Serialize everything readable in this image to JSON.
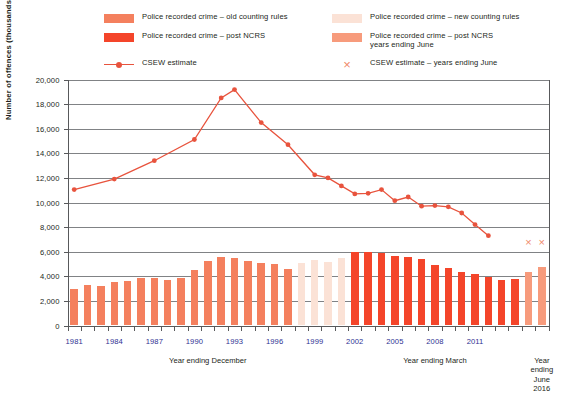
{
  "legend": {
    "items": [
      {
        "id": "old-counting-rules",
        "type": "swatch",
        "color": "#f4805e",
        "label": "Police recorded crime – old counting rules",
        "col": 0,
        "row": 0
      },
      {
        "id": "new-counting-rules",
        "type": "swatch",
        "color": "#fbe2d6",
        "label": "Police recorded crime – new counting rules",
        "col": 1,
        "row": 0
      },
      {
        "id": "post-ncrs",
        "type": "swatch",
        "color": "#f4452a",
        "label": "Police recorded crime – post NCRS",
        "col": 0,
        "row": 1
      },
      {
        "id": "post-ncrs-june",
        "type": "swatch",
        "color": "#f79b7c",
        "label": "Police recorded crime – post NCRS\nyears ending June",
        "col": 1,
        "row": 1
      },
      {
        "id": "csew-estimate",
        "type": "line",
        "color": "#e8533d",
        "label": "CSEW estimate",
        "col": 0,
        "row": 2
      },
      {
        "id": "csew-estimate-june",
        "type": "cross",
        "color": "#f08a6a",
        "label": "CSEW estimate – years ending June",
        "col": 1,
        "row": 2
      }
    ]
  },
  "chart_data": {
    "type": "bar",
    "title": "",
    "xlabel": "",
    "ylabel": "Number of offences (thousands)",
    "ylim": [
      0,
      20000
    ],
    "ytick_step": 2000,
    "ytick_labels": [
      "0",
      "2,000",
      "4,000",
      "6,000",
      "8,000",
      "10,000",
      "12,000",
      "14,000",
      "16,000",
      "18,000",
      "20,000"
    ],
    "grid": true,
    "legend_position": "top",
    "x_group_labels": [
      {
        "text": "Year ending December",
        "at_index": 10
      },
      {
        "text": "Year ending March",
        "at_index": 27
      },
      {
        "text": "Year\nending\nJune 2016",
        "at_index": 35
      }
    ],
    "xtick_labels": [
      {
        "text": "1981",
        "index": 0
      },
      {
        "text": "1984",
        "index": 3
      },
      {
        "text": "1987",
        "index": 6
      },
      {
        "text": "1990",
        "index": 9
      },
      {
        "text": "1993",
        "index": 12
      },
      {
        "text": "1996",
        "index": 15
      },
      {
        "text": "1999",
        "index": 18
      },
      {
        "text": "2002",
        "index": 21
      },
      {
        "text": "2005",
        "index": 24
      },
      {
        "text": "2008",
        "index": 27
      },
      {
        "text": "2011",
        "index": 30
      }
    ],
    "categories": [
      "1981",
      "1982",
      "1983",
      "1984",
      "1985",
      "1986",
      "1987",
      "1988",
      "1989",
      "1990",
      "1991",
      "1992",
      "1993",
      "1994",
      "1995",
      "1996",
      "1997",
      "1998",
      "1999",
      "2000",
      "2001",
      "2002",
      "2003",
      "2004",
      "2005",
      "2006",
      "2007",
      "2008",
      "2009",
      "2010",
      "2011",
      "2012",
      "2013",
      "2014",
      "2015",
      "2016"
    ],
    "series": [
      {
        "name": "Police recorded crime",
        "type": "bar",
        "values": [
          2964,
          3262,
          3247,
          3499,
          3612,
          3847,
          3892,
          3716,
          3870,
          4544,
          5276,
          5592,
          5526,
          5253,
          5100,
          5036,
          4598,
          5109,
          5301,
          5171,
          5525,
          5975,
          6014,
          5934,
          5637,
          5555,
          5427,
          4951,
          4703,
          4338,
          4205,
          3977,
          3731,
          3821,
          4356,
          4733
        ],
        "segment_colors": [
          "old",
          "old",
          "old",
          "old",
          "old",
          "old",
          "old",
          "old",
          "old",
          "old",
          "old",
          "old",
          "old",
          "old",
          "old",
          "old",
          "old",
          "new",
          "new",
          "new",
          "new",
          "ncrs",
          "ncrs",
          "ncrs",
          "ncrs",
          "ncrs",
          "ncrs",
          "ncrs",
          "ncrs",
          "ncrs",
          "ncrs",
          "ncrs",
          "ncrs",
          "ncrs",
          "june",
          "june"
        ]
      },
      {
        "name": "CSEW estimate",
        "type": "line",
        "marker": "circle",
        "color": "#e8533d",
        "points": [
          {
            "index": 0,
            "value": 11045
          },
          {
            "index": 3,
            "value": 11900
          },
          {
            "index": 6,
            "value": 13400
          },
          {
            "index": 9,
            "value": 15125
          },
          {
            "index": 11,
            "value": 18500
          },
          {
            "index": 12,
            "value": 19180
          },
          {
            "index": 14,
            "value": 16500
          },
          {
            "index": 16,
            "value": 14700
          },
          {
            "index": 18,
            "value": 12250
          },
          {
            "index": 19,
            "value": 12000
          },
          {
            "index": 20,
            "value": 11350
          },
          {
            "index": 21,
            "value": 10700
          },
          {
            "index": 22,
            "value": 10750
          },
          {
            "index": 23,
            "value": 11050
          },
          {
            "index": 24,
            "value": 10150
          },
          {
            "index": 25,
            "value": 10450
          },
          {
            "index": 26,
            "value": 9700
          },
          {
            "index": 27,
            "value": 9750
          },
          {
            "index": 28,
            "value": 9650
          },
          {
            "index": 29,
            "value": 9150
          },
          {
            "index": 30,
            "value": 8200
          },
          {
            "index": 31,
            "value": 7300
          }
        ]
      },
      {
        "name": "CSEW estimate – years ending June",
        "type": "cross",
        "color": "#f08a6a",
        "points": [
          {
            "index": 34,
            "value": 6800
          },
          {
            "index": 35,
            "value": 6800
          }
        ]
      }
    ],
    "colors": {
      "old": "#f4805e",
      "new": "#fbe2d6",
      "ncrs": "#f4452a",
      "june": "#f79b7c",
      "line": "#e8533d",
      "cross": "#f08a6a",
      "grid": "#808285",
      "axis": "#58595b",
      "xlabel": "#2e3192"
    }
  }
}
